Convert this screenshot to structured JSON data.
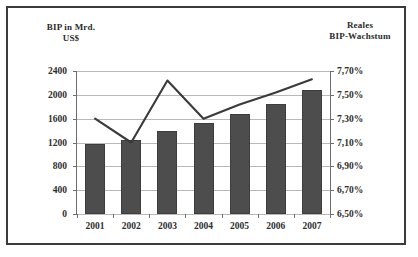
{
  "chart_data": {
    "type": "bar",
    "title": "",
    "categories": [
      "2001",
      "2002",
      "2003",
      "2004",
      "2005",
      "2006",
      "2007"
    ],
    "grid": true,
    "legend": "none",
    "series": [
      {
        "name": "BIP in Mrd. US$",
        "type": "bar",
        "axis": "left",
        "values": [
          1180,
          1250,
          1400,
          1520,
          1680,
          1850,
          2080
        ]
      },
      {
        "name": "Reales BIP-Wachstum",
        "type": "line",
        "axis": "right",
        "values": [
          7.3,
          7.1,
          7.62,
          7.3,
          7.42,
          7.52,
          7.63
        ]
      }
    ],
    "left_axis": {
      "title": "BIP in Mrd.\nUS$",
      "ylim": [
        0,
        2400
      ],
      "ticks": [
        "2400",
        "2000",
        "1600",
        "1200",
        "800",
        "400",
        "0"
      ],
      "tick_values": [
        2400,
        2000,
        1600,
        1200,
        800,
        400,
        0
      ]
    },
    "right_axis": {
      "title": "Reales\nBIP-Wachstum",
      "ylim": [
        6.5,
        7.7
      ],
      "ticks": [
        "7,70%",
        "7,50%",
        "7,30%",
        "7,10%",
        "6,90%",
        "6,70%",
        "6,50%"
      ],
      "tick_values": [
        7.7,
        7.5,
        7.3,
        7.1,
        6.9,
        6.7,
        6.5
      ]
    },
    "xlabel": "",
    "colors": {
      "bar": "#4d4d4d",
      "line": "#3a3a3a",
      "grid": "#b9b9b9",
      "axis": "#6d6d6d",
      "border": "#3b3b3b",
      "background": "#ffffff",
      "text": "#2e2e2e"
    }
  }
}
